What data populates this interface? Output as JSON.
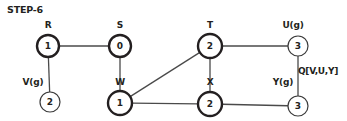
{
  "title": "STEP-6",
  "queue": {
    "label": "Q[V,U,Y]",
    "x": 318,
    "y": 71
  },
  "graph": {
    "nodes": [
      {
        "id": "R",
        "label": "R",
        "value": "1",
        "cx": 48,
        "cy": 46,
        "r": 11,
        "style": "thick",
        "label_x": 48,
        "label_y": 25
      },
      {
        "id": "S",
        "label": "S",
        "value": "0",
        "cx": 120,
        "cy": 46,
        "r": 11,
        "style": "thick",
        "label_x": 120,
        "label_y": 25
      },
      {
        "id": "T",
        "label": "T",
        "value": "2",
        "cx": 210,
        "cy": 46,
        "r": 12,
        "style": "thick",
        "label_x": 210,
        "label_y": 25
      },
      {
        "id": "U",
        "label": "U(g)",
        "value": "3",
        "cx": 298,
        "cy": 46,
        "r": 10,
        "style": "thin",
        "label_x": 293,
        "label_y": 25
      },
      {
        "id": "V",
        "label": "V(g)",
        "value": "2",
        "cx": 50,
        "cy": 102,
        "r": 10,
        "style": "thin",
        "label_x": 33,
        "label_y": 82
      },
      {
        "id": "W",
        "label": "W",
        "value": "1",
        "cx": 120,
        "cy": 103,
        "r": 12,
        "style": "thick",
        "label_x": 120,
        "label_y": 82
      },
      {
        "id": "X",
        "label": "X",
        "value": "2",
        "cx": 210,
        "cy": 104,
        "r": 12,
        "style": "thick",
        "label_x": 210,
        "label_y": 82
      },
      {
        "id": "Y",
        "label": "Y(g)",
        "value": "3",
        "cx": 298,
        "cy": 106,
        "r": 10,
        "style": "thin",
        "label_x": 283,
        "label_y": 82
      }
    ],
    "edges": [
      {
        "from": "R",
        "to": "S"
      },
      {
        "from": "R",
        "to": "V"
      },
      {
        "from": "S",
        "to": "W"
      },
      {
        "from": "W",
        "to": "T"
      },
      {
        "from": "W",
        "to": "X"
      },
      {
        "from": "T",
        "to": "X"
      },
      {
        "from": "T",
        "to": "U"
      },
      {
        "from": "U",
        "to": "Y"
      },
      {
        "from": "X",
        "to": "Y"
      }
    ]
  },
  "colors": {
    "ink": "#231f20",
    "edge": "#4a4a4a",
    "background": "#ffffff"
  }
}
